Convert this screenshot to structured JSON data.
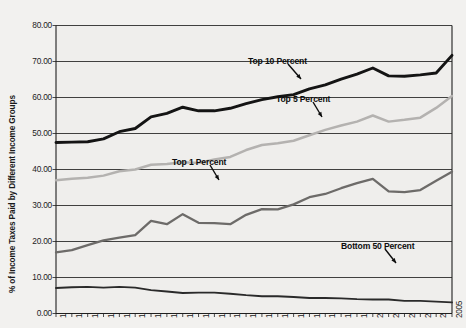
{
  "chart_data": {
    "type": "line",
    "title": "",
    "xlabel": "",
    "ylabel": "% of Income Taxes Paid by Different Income Groups",
    "ylim": [
      0,
      80
    ],
    "ytick_labels": [
      "80.00",
      "70.00",
      "60.00",
      "50.00",
      "40.00",
      "30.00",
      "20.00",
      "10.00",
      "0.00"
    ],
    "ytick_values": [
      80,
      70,
      60,
      50,
      40,
      30,
      20,
      10,
      0
    ],
    "grid": true,
    "legend_position": "inline-annotations",
    "categories": [
      "1980",
      "1981",
      "1982",
      "1983",
      "1984",
      "1985",
      "1986",
      "1987",
      "1988",
      "1989",
      "1990",
      "1991",
      "1992",
      "1993",
      "1994",
      "1995",
      "1996",
      "1997",
      "1998",
      "1999",
      "2000",
      "2001",
      "2002",
      "2003",
      "2004",
      "2005"
    ],
    "series": [
      {
        "name": "Top 10 Percent",
        "color": "#141414",
        "values": [
          47.5,
          47.6,
          47.7,
          48.5,
          50.5,
          51.4,
          54.6,
          55.6,
          57.3,
          56.3,
          56.3,
          57.0,
          58.3,
          59.4,
          60.2,
          60.8,
          62.4,
          63.5,
          65.1,
          66.5,
          68.2,
          66.0,
          65.9,
          66.3,
          66.8,
          71.7
        ]
      },
      {
        "name": "Top 5 Percent",
        "color": "#b4b2b0",
        "values": [
          37.0,
          37.4,
          37.7,
          38.3,
          39.5,
          40.0,
          41.3,
          41.5,
          42.0,
          41.8,
          42.8,
          43.5,
          45.4,
          46.8,
          47.3,
          48.0,
          49.5,
          51.0,
          52.2,
          53.3,
          55.0,
          53.3,
          53.8,
          54.4,
          57.1,
          60.4
        ]
      },
      {
        "name": "Top 1 Percent",
        "color": "#6d6b69",
        "values": [
          17.0,
          17.6,
          19.0,
          20.3,
          21.1,
          21.8,
          25.7,
          24.8,
          27.6,
          25.2,
          25.1,
          24.8,
          27.4,
          29.0,
          28.9,
          30.3,
          32.3,
          33.2,
          34.8,
          36.2,
          37.4,
          33.9,
          33.7,
          34.3,
          36.9,
          39.4
        ]
      },
      {
        "name": "Bottom 50 Percent",
        "color": "#2a2a2a",
        "values": [
          7.1,
          7.3,
          7.4,
          7.2,
          7.4,
          7.2,
          6.5,
          6.1,
          5.7,
          5.8,
          5.8,
          5.5,
          5.1,
          4.8,
          4.8,
          4.6,
          4.3,
          4.3,
          4.2,
          4.0,
          3.9,
          3.9,
          3.5,
          3.5,
          3.3,
          3.1
        ]
      }
    ],
    "annotations": [
      {
        "text": "Top 10 Percent",
        "series": "Top 10 Percent"
      },
      {
        "text": "Top 5 Percent",
        "series": "Top 5 Percent"
      },
      {
        "text": "Top 1 Percent",
        "series": "Top 1 Percent"
      },
      {
        "text": "Bottom 50 Percent",
        "series": "Bottom 50 Percent"
      }
    ]
  }
}
